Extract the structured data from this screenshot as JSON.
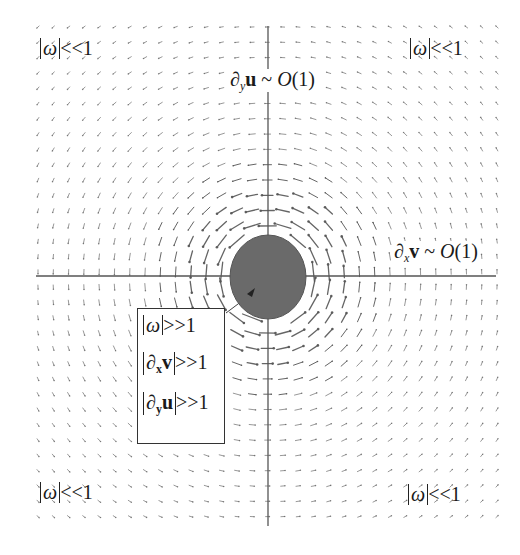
{
  "diagram": {
    "type": "vector-field",
    "core": {
      "fill": "#6a6a6a",
      "label": "vortex core"
    },
    "axes": {
      "color": "#555555"
    },
    "arrow_color": "#555555",
    "rotation": "counterclockwise"
  },
  "labels": {
    "corner_top_left": {
      "abs": "ω",
      "rel": "<<1"
    },
    "corner_top_right": {
      "abs": "ω",
      "rel": "<<1"
    },
    "corner_bottom_left": {
      "abs": "ω",
      "rel": "<<1"
    },
    "corner_bottom_right": {
      "abs": "ω",
      "rel": "<<1"
    },
    "y_axis": {
      "partial": "∂",
      "sub": "y",
      "var": "u",
      "rel": " ~ ",
      "order": "O",
      "order_arg": "(1)"
    },
    "x_axis": {
      "partial": "∂",
      "sub": "x",
      "var": "v",
      "rel": " ~ ",
      "order": "O",
      "order_arg": "(1)"
    }
  },
  "core_box": {
    "rows": [
      {
        "abs": "ω",
        "rel": ">>1"
      },
      {
        "abs_partial": "∂",
        "abs_sub": "x",
        "abs_var": "v",
        "rel": ">>1"
      },
      {
        "abs_partial": "∂",
        "abs_sub": "y",
        "abs_var": "u",
        "rel": ">>1"
      }
    ]
  }
}
